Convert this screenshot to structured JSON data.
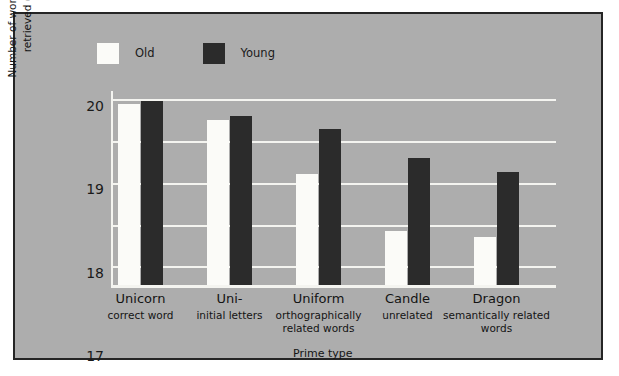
{
  "figure": {
    "background_color": "#adadad",
    "frame_color": "#252525",
    "page_color": "#ffffff"
  },
  "legend": {
    "position": "top-left",
    "items": [
      {
        "label": "Old",
        "color": "#fbfbf8"
      },
      {
        "label": "Young",
        "color": "#2b2b2b"
      }
    ]
  },
  "chart_data": {
    "type": "bar",
    "title": "",
    "subtitle": "",
    "xlabel": "Prime type",
    "ylabel": "Number of words successfully retrieved (out of 20)",
    "categories": [
      "Unicorn",
      "Uni-",
      "Uniform",
      "Candle",
      "Dragon"
    ],
    "category_sublabels": [
      "correct word",
      "initial letters",
      "orthographically related words",
      "unrelated",
      "semantically related words"
    ],
    "series": [
      {
        "name": "Old",
        "color": "#fbfbf8",
        "values": [
          19.9,
          19.5,
          18.2,
          16.85,
          16.7
        ]
      },
      {
        "name": "Young",
        "color": "#2b2b2b",
        "values": [
          19.95,
          19.6,
          19.3,
          18.6,
          18.25
        ]
      }
    ],
    "ylim": [
      15.55,
      20.2
    ],
    "yticks": [
      16,
      17,
      18,
      19,
      20
    ],
    "ytick_labels": [
      "16",
      "17",
      "18",
      "19",
      "20"
    ],
    "grid": true,
    "grid_color": "#f4f4f0",
    "grid_axis": "y",
    "legend_position": "top-left",
    "bar_width_px": 22,
    "annotations": []
  }
}
